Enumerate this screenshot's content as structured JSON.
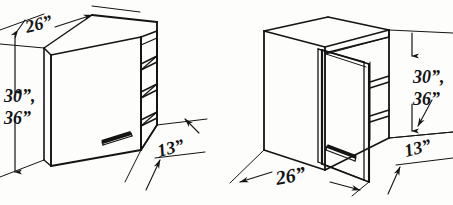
{
  "figure": {
    "style": "hand-drawn pen line illustration, two isometric cabinets",
    "ink_color": "#141414",
    "paper_color": "#fdfdfc"
  },
  "left_cabinet": {
    "name": "angled-corner-wall-cabinet-closed",
    "description": "Diagonal corner wall cabinet with angled front door and open end shelves",
    "door_handle": "horizontal bar pull",
    "shelf_count": 3,
    "dimensions": {
      "width": {
        "label": "26”",
        "position": "top-left",
        "text": "26”"
      },
      "height_primary": {
        "label": "30”,",
        "text": "30”,"
      },
      "height_secondary": {
        "label": "36”",
        "text": "36”"
      },
      "depth": {
        "label": "13”",
        "text": "13”"
      }
    }
  },
  "right_cabinet": {
    "name": "blind-corner-wall-cabinet-open",
    "description": "Square corner wall cabinet shown with hinged door swung open revealing interior shelves",
    "door_handle": "horizontal bar pull",
    "shelf_count": 2,
    "dimensions": {
      "height_primary": {
        "label": "30”,",
        "text": "30”,"
      },
      "height_secondary": {
        "label": "36”",
        "text": "36”"
      },
      "width": {
        "label": "26”",
        "text": "26”"
      },
      "depth": {
        "label": "13”",
        "text": "13”"
      }
    }
  }
}
